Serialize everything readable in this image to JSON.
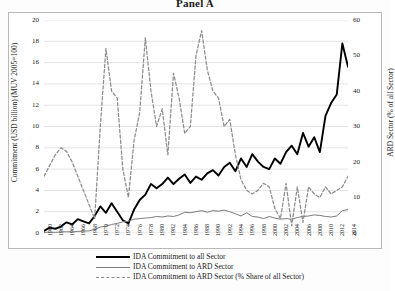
{
  "title": "Panel A",
  "axes": {
    "left_title": "Commitment (USD billion) (MUV 2005=100)",
    "right_title": "ARD Sector (% of all Sector)",
    "left_ticks": [
      "0",
      "2",
      "4",
      "6",
      "8",
      "10",
      "12",
      "14",
      "16",
      "18",
      "20"
    ],
    "right_ticks": [
      "0",
      "10",
      "20",
      "30",
      "40",
      "50",
      "60"
    ]
  },
  "legend": {
    "items": [
      {
        "label": "IDA Commitment to all Sector",
        "key": "solid-thick-black"
      },
      {
        "label": "IDA Commitment to ARD Sector",
        "key": "solid-thin-gray"
      },
      {
        "label": "IDA Commitment to ARD Sector (% Share of all Sector)",
        "key": "dashed-gray"
      }
    ]
  },
  "chart_data": {
    "type": "line",
    "title": "Panel A",
    "xlabel": "",
    "ylabel": "Commitment (USD billion) (MUV 2005=100)",
    "y2label": "ARD Sector (% of all Sector)",
    "ylim": [
      0,
      20
    ],
    "y2lim": [
      0,
      60
    ],
    "grid": true,
    "legend_position": "below",
    "x": [
      1960,
      1961,
      1962,
      1963,
      1964,
      1965,
      1966,
      1967,
      1968,
      1969,
      1970,
      1971,
      1972,
      1973,
      1974,
      1975,
      1976,
      1977,
      1978,
      1979,
      1980,
      1981,
      1982,
      1983,
      1984,
      1985,
      1986,
      1987,
      1988,
      1989,
      1990,
      1991,
      1992,
      1993,
      1994,
      1995,
      1996,
      1997,
      1998,
      1999,
      2000,
      2001,
      2002,
      2003,
      2004,
      2005,
      2006,
      2007,
      2008,
      2009,
      2010,
      2011,
      2012,
      2013,
      2014
    ],
    "tick_labels": [
      "1960",
      "1962",
      "1964",
      "1966",
      "1968",
      "1970",
      "1972",
      "1974",
      "1976",
      "1978",
      "1980",
      "1982",
      "1984",
      "1986",
      "1988",
      "1990",
      "1992",
      "1994",
      "1996",
      "1998",
      "2000",
      "2002",
      "2004",
      "2006",
      "2008",
      "2010",
      "2012",
      "2014"
    ],
    "series": [
      {
        "name": "IDA Commitment to all Sector",
        "axis": "left",
        "style": "solid-thick-black",
        "color": "#000000",
        "values": [
          0.2,
          0.5,
          0.4,
          0.6,
          1.0,
          0.8,
          1.3,
          1.1,
          0.9,
          1.6,
          2.5,
          1.9,
          2.8,
          2.0,
          1.2,
          0.9,
          2.2,
          3.1,
          3.6,
          4.6,
          4.2,
          4.6,
          5.2,
          4.6,
          5.1,
          5.5,
          4.7,
          5.3,
          5.0,
          5.6,
          5.9,
          5.4,
          6.2,
          6.6,
          5.8,
          7.0,
          6.2,
          7.4,
          6.7,
          6.2,
          6.0,
          7.0,
          6.5,
          7.6,
          8.2,
          7.4,
          9.4,
          8.1,
          9.0,
          7.6,
          11.0,
          12.2,
          13.0,
          17.8,
          15.6
        ]
      },
      {
        "name": "IDA Commitment to ARD Sector",
        "axis": "left",
        "style": "solid-thin-gray",
        "color": "#7b7b7b",
        "values": [
          0.05,
          0.08,
          0.06,
          0.1,
          0.12,
          0.1,
          0.15,
          0.18,
          0.2,
          0.35,
          0.55,
          0.65,
          0.8,
          0.9,
          1.05,
          1.1,
          1.3,
          1.35,
          1.4,
          1.45,
          1.55,
          1.5,
          1.6,
          1.55,
          1.7,
          1.95,
          1.9,
          2.0,
          2.1,
          1.95,
          2.1,
          2.05,
          2.15,
          2.0,
          1.8,
          1.6,
          1.9,
          1.55,
          1.5,
          1.35,
          1.55,
          1.4,
          1.3,
          1.35,
          1.3,
          1.45,
          1.55,
          1.6,
          1.7,
          1.65,
          1.55,
          1.5,
          1.6,
          2.1,
          2.2
        ]
      },
      {
        "name": "IDA Commitment to ARD Sector (% Share of all Sector)",
        "axis": "right",
        "style": "dashed-gray",
        "color": "#8d8d8d",
        "values": [
          16,
          19,
          22,
          24,
          23,
          20,
          16,
          12,
          8,
          4,
          30,
          52,
          40,
          38,
          18,
          10,
          26,
          34,
          55,
          40,
          30,
          35,
          22,
          45,
          38,
          28,
          30,
          50,
          57,
          46,
          40,
          38,
          30,
          32,
          22,
          15,
          12,
          11,
          12,
          14,
          13,
          7,
          4,
          14,
          2,
          13,
          3,
          13,
          11,
          10,
          13,
          11,
          12,
          13,
          16
        ]
      }
    ]
  }
}
